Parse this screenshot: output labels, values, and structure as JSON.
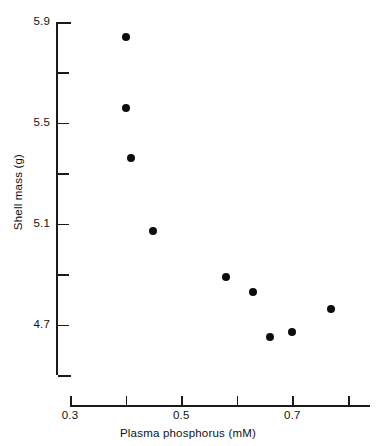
{
  "chart_data": {
    "type": "scatter",
    "title": "",
    "xlabel": "Plasma phosphorus (mM)",
    "ylabel": "Shell mass (g)",
    "xlim": [
      0.3,
      0.83
    ],
    "ylim": [
      4.5,
      5.9
    ],
    "grid": false,
    "legend": null,
    "x_ticks": [
      {
        "value": 0.3,
        "label": "0.3",
        "major": true
      },
      {
        "value": 0.4,
        "label": "",
        "major": false
      },
      {
        "value": 0.5,
        "label": "0.5",
        "major": true
      },
      {
        "value": 0.6,
        "label": "",
        "major": false
      },
      {
        "value": 0.7,
        "label": "0.7",
        "major": true
      },
      {
        "value": 0.8,
        "label": "",
        "major": false
      }
    ],
    "y_ticks": [
      {
        "value": 5.9,
        "label": "5.9",
        "major": true
      },
      {
        "value": 5.7,
        "label": "",
        "major": false
      },
      {
        "value": 5.5,
        "label": "5.5",
        "major": true
      },
      {
        "value": 5.3,
        "label": "",
        "major": false
      },
      {
        "value": 5.1,
        "label": "5.1",
        "major": true
      },
      {
        "value": 4.9,
        "label": "",
        "major": false
      },
      {
        "value": 4.7,
        "label": "4.7",
        "major": true
      },
      {
        "value": 4.5,
        "label": "",
        "major": false
      }
    ],
    "series": [
      {
        "name": "Shell mass vs plasma phosphorus",
        "marker": "filled-circle",
        "color": "#0d0d0d",
        "points": [
          {
            "x": 0.4,
            "y": 5.84
          },
          {
            "x": 0.4,
            "y": 5.56
          },
          {
            "x": 0.41,
            "y": 5.36
          },
          {
            "x": 0.45,
            "y": 5.07
          },
          {
            "x": 0.58,
            "y": 4.89
          },
          {
            "x": 0.63,
            "y": 4.83
          },
          {
            "x": 0.66,
            "y": 4.65
          },
          {
            "x": 0.7,
            "y": 4.67
          },
          {
            "x": 0.77,
            "y": 4.76
          }
        ]
      }
    ]
  },
  "colors": {
    "axis": "#1a1a1a",
    "marker": "#0d0d0d",
    "background": "#ffffff",
    "text": "#111111"
  }
}
